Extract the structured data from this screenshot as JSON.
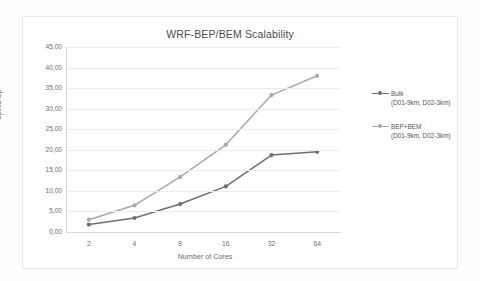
{
  "chart_data": {
    "type": "line",
    "title": "WRF-BEP/BEM Scalability",
    "xlabel": "Number of Cores",
    "ylabel": "Speed Up",
    "categories": [
      "2",
      "4",
      "8",
      "16",
      "32",
      "64"
    ],
    "ytick_labels": [
      "0,00",
      "5,00",
      "10,00",
      "15,00",
      "20,00",
      "25,00",
      "30,00",
      "35,00",
      "40,00",
      "45,00"
    ],
    "ylim": [
      0,
      45
    ],
    "ytick_step": 5,
    "grid": true,
    "legend_position": "right",
    "series": [
      {
        "name": "Bulk",
        "sub": "(D01-9km, D02-3km)",
        "color": "#6f6f6f",
        "marker": "circle",
        "values": [
          1.8,
          3.4,
          6.8,
          11.1,
          18.7,
          19.5
        ]
      },
      {
        "name": "BEP+BEM",
        "sub": "(D01-9km, D02-3km)",
        "color": "#a8a8a8",
        "marker": "circle",
        "values": [
          3.0,
          6.5,
          13.4,
          21.2,
          33.3,
          38.0
        ]
      }
    ]
  }
}
